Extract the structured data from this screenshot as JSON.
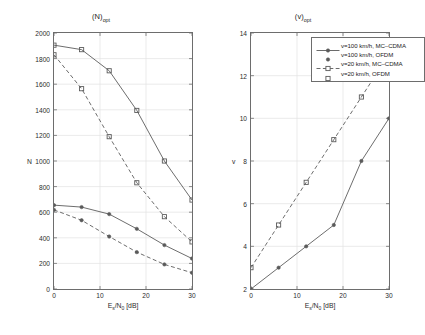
{
  "figure": {
    "background_color": "#ffffff",
    "line_color": "#5a5a5a",
    "axis_color": "#6d6d6d",
    "grid_color": "#e2e2e2",
    "text_color": "#2b2b2b"
  },
  "legend": {
    "position": "upper-left-of-right-panel",
    "entries": [
      {
        "label": "v=100 km/h, MC–CDMA",
        "style": "solid",
        "marker": "dot",
        "color": "#5a5a5a"
      },
      {
        "label": "v=100 km/h, OFDM",
        "style": "none",
        "marker": "dot",
        "color": "#5a5a5a"
      },
      {
        "label": "v=20 km/h, MC–CDMA",
        "style": "dashed",
        "marker": "square",
        "color": "#5a5a5a"
      },
      {
        "label": "v=20 km/h, OFDM",
        "style": "none",
        "marker": "square",
        "color": "#5a5a5a"
      }
    ]
  },
  "chart_data": [
    {
      "id": "left",
      "type": "line",
      "title": "(N)",
      "title_sub": "opt",
      "xlabel": "E",
      "xlabel_sub1": "s",
      "xlabel_mid": "/N",
      "xlabel_sub2": "0",
      "xlabel_end": " [dB]",
      "ylabel": "N",
      "xlim": [
        0,
        30
      ],
      "ylim": [
        0,
        2000
      ],
      "xticks": [
        0,
        10,
        20,
        30
      ],
      "xtick_labels": [
        "0",
        "10",
        "20",
        "30"
      ],
      "yticks": [
        0,
        200,
        400,
        600,
        800,
        1000,
        1200,
        1400,
        1600,
        1800,
        2000
      ],
      "ytick_labels": [
        "0",
        "200",
        "400",
        "600",
        "800",
        "1000",
        "1200",
        "1400",
        "1600",
        "1800",
        "2000"
      ],
      "grid": true,
      "x": [
        0,
        6,
        12,
        18,
        24,
        30
      ],
      "series": [
        {
          "name": "v=20 km/h, MC–CDMA",
          "style": "solid",
          "marker": "square",
          "values": [
            1905,
            1870,
            1705,
            1395,
            1000,
            695
          ]
        },
        {
          "name": "v=20 km/h, OFDM",
          "style": "dashed",
          "marker": "square",
          "values": [
            1830,
            1565,
            1190,
            830,
            565,
            368
          ]
        },
        {
          "name": "v=100 km/h, MC–CDMA",
          "style": "solid",
          "marker": "dot",
          "values": [
            655,
            640,
            585,
            470,
            343,
            238
          ]
        },
        {
          "name": "v=100 km/h, OFDM",
          "style": "dashed",
          "marker": "dot",
          "values": [
            618,
            537,
            410,
            288,
            192,
            127
          ]
        }
      ]
    },
    {
      "id": "right",
      "type": "line",
      "title": "(v)",
      "title_sub": "opt",
      "xlabel": "E",
      "xlabel_sub1": "s",
      "xlabel_mid": "/N",
      "xlabel_sub2": "0",
      "xlabel_end": " [dB]",
      "ylabel": "v",
      "xlim": [
        0,
        30
      ],
      "ylim": [
        2,
        14
      ],
      "xticks": [
        0,
        10,
        20,
        30
      ],
      "xtick_labels": [
        "0",
        "10",
        "20",
        "30"
      ],
      "yticks": [
        2,
        4,
        6,
        8,
        10,
        12,
        14
      ],
      "ytick_labels": [
        "2",
        "4",
        "6",
        "8",
        "10",
        "12",
        "14"
      ],
      "grid": true,
      "x": [
        0,
        6,
        12,
        18,
        24,
        30
      ],
      "series": [
        {
          "name": "v=20 km/h, MC–CDMA",
          "style": "dashed",
          "marker": "square",
          "values": [
            3,
            5,
            7,
            9,
            11,
            13
          ]
        },
        {
          "name": "v=100 km/h, MC–CDMA",
          "style": "solid",
          "marker": "dot",
          "values": [
            2,
            3,
            4,
            5,
            8,
            10
          ]
        }
      ]
    }
  ]
}
